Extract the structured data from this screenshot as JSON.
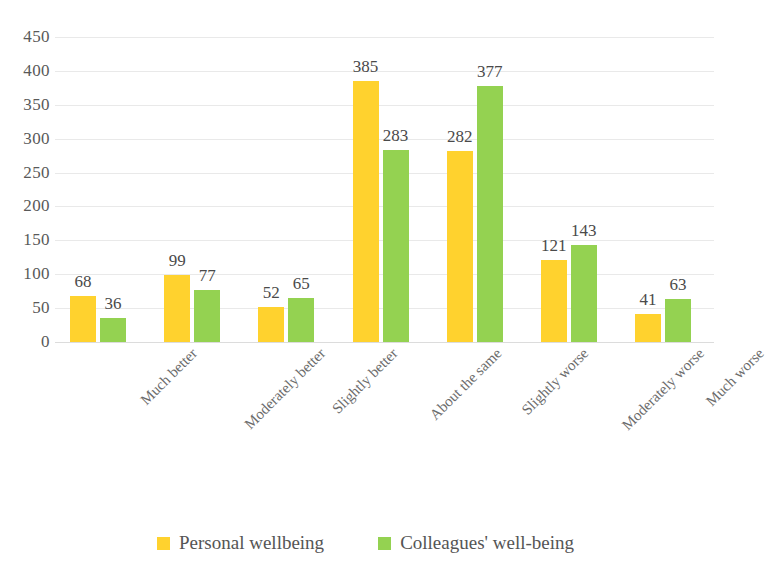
{
  "chart_data": {
    "type": "bar",
    "title": "",
    "subtitle": "",
    "xlabel": "",
    "ylabel": "",
    "ylim": [
      0,
      450
    ],
    "ytick_step": 50,
    "yticks": [
      "450",
      "400",
      "350",
      "300",
      "250",
      "200",
      "150",
      "100",
      "50",
      "0"
    ],
    "grid": true,
    "grid_axis": "y",
    "legend_position": "bottom-center",
    "categories": [
      "Much better",
      "Moderately better",
      "Slightly better",
      "About the same",
      "Slightly worse",
      "Moderately worse",
      "Much worse"
    ],
    "series": [
      {
        "name": "Personal wellbeing",
        "color": "#ffd22e",
        "values": [
          68,
          99,
          52,
          385,
          282,
          121,
          41
        ]
      },
      {
        "name": "Colleagues' well-being",
        "color": "#94d251",
        "values": [
          36,
          77,
          65,
          283,
          377,
          143,
          63
        ]
      }
    ],
    "data_labels": [
      [
        "68",
        "36"
      ],
      [
        "99",
        "77"
      ],
      [
        "52",
        "65"
      ],
      [
        "385",
        "283"
      ],
      [
        "282",
        "377"
      ],
      [
        "121",
        "143"
      ],
      [
        "41",
        "63"
      ]
    ]
  },
  "legend": {
    "items": [
      {
        "label": "Personal wellbeing",
        "color": "#ffd22e"
      },
      {
        "label": "Colleagues' well-being",
        "color": "#94d251"
      }
    ]
  }
}
